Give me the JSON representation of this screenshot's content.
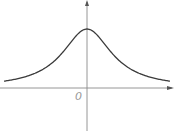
{
  "diagram": {
    "type": "function-graph",
    "origin_label": "0",
    "colors": {
      "axes": "#8a8a8a",
      "curve": "#3a3a3a",
      "label": "#9a9a9a",
      "background": "#ffffff"
    },
    "axes": {
      "x_axis": {
        "y": 88,
        "x_start": 0,
        "x_end": 174,
        "arrow": "right"
      },
      "y_axis": {
        "x": 87,
        "y_start": 131,
        "y_end": 0,
        "arrow": "up"
      }
    },
    "curve": {
      "function": "y = A / (1 + (x/w)^2)",
      "peak_px": [
        87,
        29
      ],
      "amplitude_px": 59,
      "width_px": 30,
      "x_range_px": [
        4,
        170
      ]
    }
  }
}
